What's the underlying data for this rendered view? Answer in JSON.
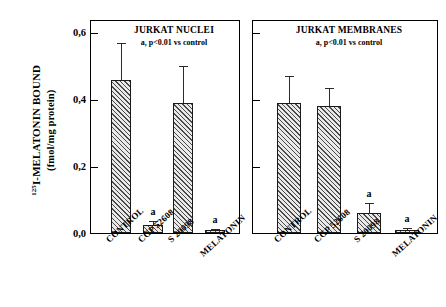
{
  "figure": {
    "y_axis": {
      "title_line1_prefix": "125",
      "title_line1": "I-MELATONIN BOUND",
      "title_line2": "(fmol/mg protein)",
      "ticks": [
        "0,0",
        "0,2",
        "0,4",
        "0,6"
      ],
      "tick_values": [
        0.0,
        0.2,
        0.4,
        0.6
      ],
      "min": 0.0,
      "max": 0.6
    },
    "panels": [
      {
        "id": "nuclei",
        "title": "JURKAT NUCLEI",
        "subtitle": "a, p<0.01 vs control"
      },
      {
        "id": "membranes",
        "title": "JURKAT MEMBRANES",
        "subtitle": "a, p<0.01 vs control"
      }
    ]
  },
  "chart_data": {
    "type": "bar",
    "xlabel": "",
    "ylabel": "125I-MELATONIN BOUND (fmol/mg protein)",
    "ylim": [
      0.0,
      0.6
    ],
    "yticks": [
      0.0,
      0.2,
      0.4,
      0.6
    ],
    "ytick_labels": [
      "0,0",
      "0,2",
      "0,4",
      "0,6"
    ],
    "grid": false,
    "legend": "none",
    "error_bars": "upper only (SEM)",
    "categories": [
      "CONTROL",
      "CGP 52608",
      "S 20098",
      "MELATONIN"
    ],
    "panels": [
      {
        "name": "JURKAT NUCLEI",
        "annotation": "a, p<0.01 vs control",
        "values": [
          0.46,
          0.025,
          0.39,
          0.008
        ],
        "errors": [
          0.11,
          0.012,
          0.11,
          0.003
        ],
        "significance": [
          "",
          "a",
          "",
          "a"
        ]
      },
      {
        "name": "JURKAT MEMBRANES",
        "annotation": "a, p<0.01 vs control",
        "values": [
          0.39,
          0.38,
          0.06,
          0.01
        ],
        "errors": [
          0.08,
          0.055,
          0.03,
          0.004
        ],
        "significance": [
          "",
          "",
          "a",
          "a"
        ]
      }
    ]
  },
  "colors": {
    "bar_fill": "#e9e9e9",
    "bar_hatch": "#4a4a4a",
    "axis": "#000000",
    "background": "#ffffff"
  }
}
